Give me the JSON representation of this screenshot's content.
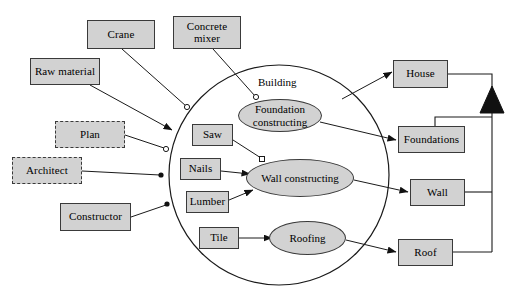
{
  "diagram": {
    "title_label": "Building",
    "system_boundary": {
      "name": "building-system-boundary",
      "shape": "circle",
      "cx": 279,
      "cy": 175,
      "r": 110
    },
    "colors": {
      "node_fill": "#d2d2d2",
      "stroke": "#3a3a3a",
      "line": "#1a1a1a",
      "background": "#ffffff"
    },
    "external_actors": [
      {
        "id": "crane",
        "label": "Crane",
        "style": "solid",
        "x": 87,
        "y": 20,
        "w": 68,
        "h": 29
      },
      {
        "id": "concrete-mixer",
        "label": "Concrete mixer",
        "style": "solid",
        "x": 173,
        "y": 16,
        "w": 68,
        "h": 33
      },
      {
        "id": "raw-material",
        "label": "Raw material",
        "style": "solid",
        "x": 30,
        "y": 58,
        "w": 70,
        "h": 27
      },
      {
        "id": "plan",
        "label": "Plan",
        "style": "dashed",
        "x": 55,
        "y": 121,
        "w": 70,
        "h": 27
      },
      {
        "id": "architect",
        "label": "Architect",
        "style": "dashed",
        "x": 12,
        "y": 157,
        "w": 70,
        "h": 27
      },
      {
        "id": "constructor",
        "label": "Constructor",
        "style": "solid",
        "x": 60,
        "y": 203,
        "w": 71,
        "h": 28
      }
    ],
    "internal_resources": [
      {
        "id": "saw",
        "label": "Saw",
        "x": 192,
        "y": 124,
        "w": 41,
        "h": 22
      },
      {
        "id": "nails",
        "label": "Nails",
        "x": 180,
        "y": 158,
        "w": 41,
        "h": 22
      },
      {
        "id": "lumber",
        "label": "Lumber",
        "x": 186,
        "y": 191,
        "w": 43,
        "h": 22
      },
      {
        "id": "tile",
        "label": "Tile",
        "x": 199,
        "y": 227,
        "w": 40,
        "h": 22
      }
    ],
    "activities": [
      {
        "id": "foundation-constructing",
        "label": "Foundation constructing",
        "x": 238,
        "y": 99,
        "w": 84,
        "h": 33
      },
      {
        "id": "wall-constructing",
        "label": "Wall constructing",
        "x": 246,
        "y": 159,
        "w": 108,
        "h": 38
      },
      {
        "id": "roofing",
        "label": "Roofing",
        "x": 269,
        "y": 221,
        "w": 77,
        "h": 34
      }
    ],
    "products": [
      {
        "id": "house",
        "label": "House",
        "x": 393,
        "y": 60,
        "w": 55,
        "h": 28
      },
      {
        "id": "foundations",
        "label": "Foundations",
        "x": 398,
        "y": 126,
        "w": 67,
        "h": 27
      },
      {
        "id": "wall",
        "label": "Wall",
        "x": 410,
        "y": 179,
        "w": 55,
        "h": 27
      },
      {
        "id": "roof",
        "label": "Roof",
        "x": 398,
        "y": 239,
        "w": 55,
        "h": 27
      }
    ],
    "generalization": {
      "name": "generalization-triangle",
      "parent": "House",
      "children": [
        "Foundations",
        "Wall",
        "Roof"
      ]
    }
  }
}
